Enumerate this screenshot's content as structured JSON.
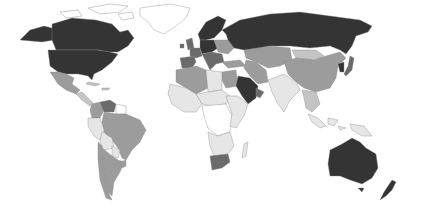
{
  "map": {
    "type": "choropleth-world",
    "palette": {
      "darkest": "#343434",
      "dark": "#6a6a6a",
      "medium": "#9c9c9c",
      "light": "#c4c4c4",
      "lightest": "#e6e6e6",
      "none": "#ffffff",
      "border": "#8a8a8a"
    },
    "regions": [
      {
        "id": "canada",
        "shade": "darkest"
      },
      {
        "id": "usa",
        "shade": "darkest"
      },
      {
        "id": "alaska",
        "shade": "darkest"
      },
      {
        "id": "greenland",
        "shade": "none"
      },
      {
        "id": "mexico",
        "shade": "medium"
      },
      {
        "id": "central-america",
        "shade": "light"
      },
      {
        "id": "caribbean",
        "shade": "light"
      },
      {
        "id": "venezuela",
        "shade": "dark"
      },
      {
        "id": "colombia",
        "shade": "medium"
      },
      {
        "id": "guianas",
        "shade": "none"
      },
      {
        "id": "brazil",
        "shade": "medium"
      },
      {
        "id": "peru",
        "shade": "lightest"
      },
      {
        "id": "bolivia",
        "shade": "lightest"
      },
      {
        "id": "paraguay",
        "shade": "lightest"
      },
      {
        "id": "chile",
        "shade": "medium"
      },
      {
        "id": "argentina",
        "shade": "medium"
      },
      {
        "id": "uruguay",
        "shade": "medium"
      },
      {
        "id": "uk-ireland",
        "shade": "dark"
      },
      {
        "id": "iberia",
        "shade": "dark"
      },
      {
        "id": "france",
        "shade": "dark"
      },
      {
        "id": "central-europe",
        "shade": "darkest"
      },
      {
        "id": "scandinavia",
        "shade": "darkest"
      },
      {
        "id": "italy-balkans",
        "shade": "dark"
      },
      {
        "id": "eastern-europe",
        "shade": "medium"
      },
      {
        "id": "russia",
        "shade": "darkest"
      },
      {
        "id": "turkey",
        "shade": "medium"
      },
      {
        "id": "caucasus-iran",
        "shade": "medium"
      },
      {
        "id": "central-asia",
        "shade": "medium"
      },
      {
        "id": "mongolia",
        "shade": "light"
      },
      {
        "id": "china",
        "shade": "medium"
      },
      {
        "id": "korea",
        "shade": "darkest"
      },
      {
        "id": "japan",
        "shade": "dark"
      },
      {
        "id": "saudi-arabia",
        "shade": "darkest"
      },
      {
        "id": "gulf-states",
        "shade": "dark"
      },
      {
        "id": "egypt-levant",
        "shade": "medium"
      },
      {
        "id": "north-africa",
        "shade": "medium"
      },
      {
        "id": "libya",
        "shade": "lightest"
      },
      {
        "id": "west-africa",
        "shade": "lightest"
      },
      {
        "id": "sahel",
        "shade": "lightest"
      },
      {
        "id": "central-africa",
        "shade": "none"
      },
      {
        "id": "east-africa",
        "shade": "lightest"
      },
      {
        "id": "southern-africa",
        "shade": "lightest"
      },
      {
        "id": "south-africa",
        "shade": "dark"
      },
      {
        "id": "madagascar",
        "shade": "lightest"
      },
      {
        "id": "south-asia",
        "shade": "lightest"
      },
      {
        "id": "southeast-asia",
        "shade": "light"
      },
      {
        "id": "indonesia",
        "shade": "lightest"
      },
      {
        "id": "papua",
        "shade": "lightest"
      },
      {
        "id": "australia",
        "shade": "darkest"
      },
      {
        "id": "new-zealand",
        "shade": "darkest"
      }
    ]
  }
}
